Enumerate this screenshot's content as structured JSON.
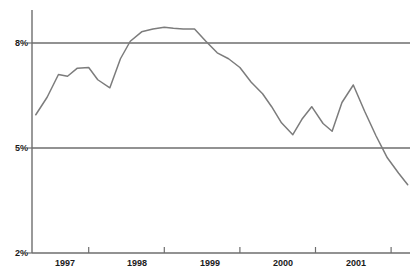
{
  "chart_data": {
    "type": "line",
    "title": "",
    "subtitle": "",
    "xlabel": "",
    "ylabel": "",
    "legend": [],
    "grid": true,
    "gridlines_y": [
      5,
      8
    ],
    "ylim": [
      2,
      8.9
    ],
    "xlim": [
      1996.75,
      2001.75
    ],
    "y_tick_labels": [
      "2%",
      "5%",
      "8%"
    ],
    "y_tick_values": [
      2,
      5,
      8
    ],
    "x_tick_labels": [
      "1997",
      "1998",
      "1999",
      "2000",
      "2001"
    ],
    "x_tick_values": [
      1997,
      1998,
      1999,
      2000,
      2001
    ],
    "series": [
      {
        "name": "rate",
        "color": "#7c7c7c",
        "x": [
          1996.8,
          1996.95,
          1997.1,
          1997.22,
          1997.35,
          1997.5,
          1997.62,
          1997.78,
          1997.92,
          1998.05,
          1998.2,
          1998.35,
          1998.5,
          1998.62,
          1998.75,
          1998.9,
          1999.05,
          1999.2,
          1999.35,
          1999.5,
          1999.65,
          1999.8,
          1999.92,
          2000.05,
          2000.2,
          2000.32,
          2000.45,
          2000.6,
          2000.72,
          2000.85,
          2001.0,
          2001.15,
          2001.3,
          2001.45,
          2001.6,
          2001.72
        ],
        "y": [
          5.95,
          6.45,
          7.1,
          7.05,
          7.28,
          7.3,
          6.95,
          6.72,
          7.55,
          8.05,
          8.32,
          8.4,
          8.45,
          8.42,
          8.4,
          8.4,
          8.05,
          7.72,
          7.55,
          7.3,
          6.88,
          6.55,
          6.18,
          5.72,
          5.38,
          5.82,
          6.18,
          5.7,
          5.48,
          6.3,
          6.8,
          6.05,
          5.35,
          4.72,
          4.28,
          3.95
        ]
      }
    ],
    "colors": {
      "line": "#7c7c7c",
      "axis": "#6e6e6e",
      "gridline": "#6e6e6e",
      "text": "#1a1a1a",
      "background": "#ffffff"
    },
    "geometry": {
      "plot_left": 32,
      "plot_right": 410,
      "plot_top": 10,
      "plot_bottom": 253,
      "y_at_2pct": 253,
      "y_at_5pct": 148,
      "y_at_8pct": 43
    }
  }
}
